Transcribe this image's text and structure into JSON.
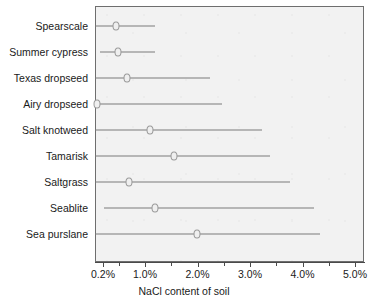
{
  "chart_data": {
    "type": "range-dot",
    "title": "",
    "xlabel": "NaCl content of soil",
    "ylabel": "",
    "xlim": [
      0.05,
      5.18
    ],
    "xticks": [
      0.2,
      1.0,
      2.0,
      3.0,
      4.0,
      5.0
    ],
    "xticklabels": [
      "0.2%",
      "1.0%",
      "2.0%",
      "3.0%",
      "4.0%",
      "5.0%"
    ],
    "grid": false,
    "legend": null,
    "categories": [
      "Spearscale",
      "Summer cypress",
      "Texas dropseed",
      "Airy dropseed",
      "Salt knotweed",
      "Tamarisk",
      "Saltgrass",
      "Seablite",
      "Sea purslane"
    ],
    "rows": [
      {
        "label": "Spearscale",
        "min": 0.05,
        "max": 1.19,
        "value": 0.45
      },
      {
        "label": "Summer cypress",
        "min": 0.14,
        "max": 1.19,
        "value": 0.49
      },
      {
        "label": "Texas dropseed",
        "min": 0.05,
        "max": 2.24,
        "value": 0.66
      },
      {
        "label": "Airy dropseed",
        "min": 0.09,
        "max": 2.47,
        "value": 0.09
      },
      {
        "label": "Salt knotweed",
        "min": 0.05,
        "max": 3.23,
        "value": 1.1
      },
      {
        "label": "Tamarisk",
        "min": 0.05,
        "max": 3.38,
        "value": 1.55
      },
      {
        "label": "Saltgrass",
        "min": 0.05,
        "max": 3.76,
        "value": 0.7
      },
      {
        "label": "Seablite",
        "min": 0.22,
        "max": 4.22,
        "value": 1.19
      },
      {
        "label": "Sea purslane",
        "min": 0.05,
        "max": 4.33,
        "value": 1.99
      }
    ],
    "colors": {
      "plot_background": "#f2f2f2",
      "plot_border": "#6e6e6e",
      "line": "#7a7a7a",
      "marker_fill": "#efefef",
      "marker_stroke": "#9a9a9a",
      "text": "#1a1a1a",
      "axis": "#4a4a4a"
    }
  }
}
